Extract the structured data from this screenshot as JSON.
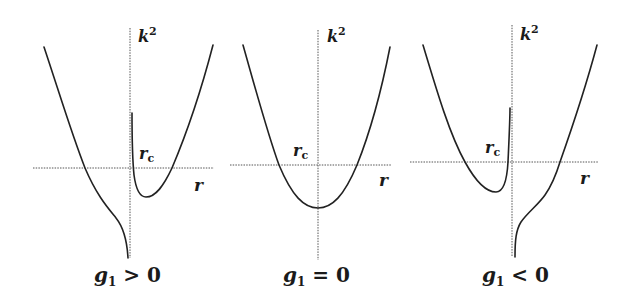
{
  "diagram": {
    "panels": [
      {
        "id": "g1-positive",
        "caption": {
          "var": "g",
          "sub": "1",
          "rel": " > 0"
        },
        "y_axis_label": {
          "base": "k",
          "sup": "2"
        },
        "x_axis_label": "r",
        "critical_label": {
          "base": "r",
          "sub": "c"
        }
      },
      {
        "id": "g1-zero",
        "caption": {
          "var": "g",
          "sub": "1",
          "rel": " = 0"
        },
        "y_axis_label": {
          "base": "k",
          "sup": "2"
        },
        "x_axis_label": "r",
        "critical_label": {
          "base": "r",
          "sub": "c"
        }
      },
      {
        "id": "g1-negative",
        "caption": {
          "var": "g",
          "sub": "1",
          "rel": " < 0"
        },
        "y_axis_label": {
          "base": "k",
          "sup": "2"
        },
        "x_axis_label": "r",
        "critical_label": {
          "base": "r",
          "sub": "c"
        }
      }
    ]
  },
  "colors": {
    "background": "#ffffff",
    "curve": "#222222",
    "axis": "#555555",
    "text": "#1a1a1a"
  }
}
